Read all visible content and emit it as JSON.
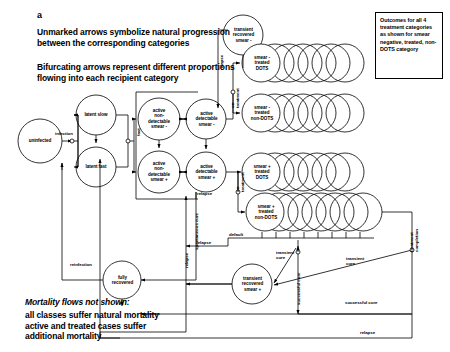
{
  "panel": {
    "letter": "a",
    "note1": "Unmarked arrows symbolize natural progression\nbetween the corresponding categories",
    "note2": "Bifurcating arrows represent different proportions\nflowing into each recipient category",
    "mortality_title": "Mortality flows not shown:",
    "mortality_body": "all classes suffer natural mortality\nactive and treated cases suffer\nadditional mortality"
  },
  "infobox": {
    "text": "Outcomes for all 4 treatment categories as shown for smear negative, treated, non-DOTS category"
  },
  "nodes": {
    "uninfected": "uninfected",
    "latent_slow": "latent slow",
    "latent_fast": "latent fast",
    "active_nondet_neg": "active\nnon-\ndetectable\nsmear -",
    "active_nondet_pos": "active\nnon-\ndetectable\nsmear +",
    "active_det_neg": "active\ndetectable\nsmear -",
    "active_det_pos": "active\ndetectable\nsmear +",
    "trans_rec_neg": "transient\nrecovered\nsmear -",
    "trans_rec_pos": "transient\nrecovered\nsmear +",
    "fully_recovered": "fully\nrecovered",
    "treat_neg_dots": "smear -\ntreated\nDOTS",
    "treat_neg_nondots": "smear -\ntreated\nnon-DOTS",
    "treat_pos_dots": "smear +\ntreated\nDOTS",
    "treat_pos_nondots": "smear +\ntreated\nnon-DOTS"
  },
  "edges": {
    "infection": "infection",
    "fast": "fast",
    "relapse_top": "relapse",
    "on_treatment_top": "on\ntreatment",
    "on_treatment_bottom": "on\ntreatment",
    "spontaneous_cure": "spontaneous cure",
    "relapse_mid": "relapse",
    "relapse_left": "relapse",
    "relapse_lower": "relapse",
    "reinfection": "reinfection",
    "default": "default",
    "successful_cure_vert": "successful cure",
    "transient_cure_left": "transient\ncure",
    "transient_cure_right": "transient\ncure",
    "successful_cure": "successful cure",
    "relapse_bottom": "relapse",
    "treatment_completion": "treatment\ncompletion"
  },
  "stack_counts": {
    "treat_neg_dots": 7,
    "treat_neg_nondots": 7,
    "treat_pos_dots": 7,
    "treat_pos_nondots": 7
  },
  "colors": {
    "stroke": "#000000",
    "background": "#ffffff"
  }
}
